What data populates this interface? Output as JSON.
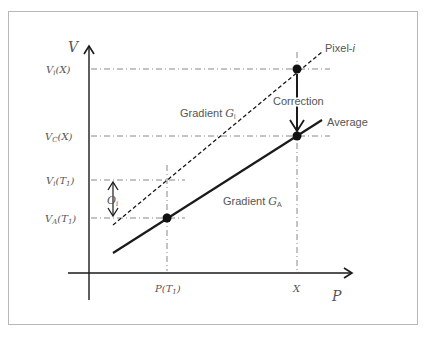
{
  "diagram": {
    "axes": {
      "y_label": "V",
      "x_label": "P"
    },
    "y_ticks": [
      {
        "id": "vi_x",
        "main": "V",
        "sub": "i",
        "arg": "(X)"
      },
      {
        "id": "vc_x",
        "main": "V",
        "sub": "C",
        "arg": "(X)"
      },
      {
        "id": "vi_t1",
        "main": "V",
        "sub": "i",
        "arg": "(T",
        "arg_sub": "1",
        "arg_end": ")"
      },
      {
        "id": "va_t1",
        "main": "V",
        "sub": "A",
        "arg": "(T",
        "arg_sub": "1",
        "arg_end": ")"
      }
    ],
    "x_ticks": [
      {
        "id": "p_t1",
        "main": "P",
        "arg": "(T",
        "arg_sub": "1",
        "arg_end": ")"
      },
      {
        "id": "x",
        "main": "X"
      }
    ],
    "lines": {
      "pixel": {
        "label": "Pixel-",
        "label_italic": "i",
        "style": "dashed"
      },
      "average": {
        "label": "Average",
        "style": "solid"
      }
    },
    "annotations": {
      "gradient_i": {
        "text": "Gradient ",
        "symbol": "G",
        "sub": "i"
      },
      "gradient_a": {
        "text": "Gradient ",
        "symbol": "G",
        "sub": "A"
      },
      "correction": "Correction",
      "offset": {
        "symbol": "O",
        "sub": "i"
      }
    },
    "colors": {
      "line": "#1a1a1a",
      "guide": "#7a7a7a",
      "text": "#555555",
      "frame": "#b8b8b8"
    }
  }
}
